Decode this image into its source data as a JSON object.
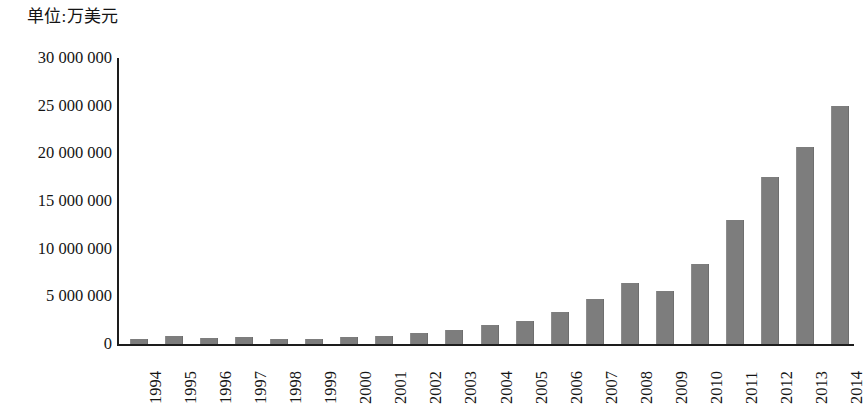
{
  "caption": {
    "unit_label": "单位:万美元"
  },
  "axes": {
    "y_tick_labels": [
      "30 000 000",
      "25 000 000",
      "20 000 000",
      "15 000 000",
      "10 000 000",
      "5 000 000",
      "0"
    ],
    "y_tick_values": [
      30000000,
      25000000,
      20000000,
      15000000,
      10000000,
      5000000,
      0
    ],
    "x_tick_labels": [
      "1994",
      "1995",
      "1996",
      "1997",
      "1998",
      "1999",
      "2000",
      "2001",
      "2002",
      "2003",
      "2004",
      "2005",
      "2006",
      "2007",
      "2008",
      "2009",
      "2010",
      "2011",
      "2012",
      "2013",
      "2014"
    ]
  },
  "style": {
    "bar_color": "#7d7d7d",
    "axis_color": "#1d1d1d",
    "background": "#ffffff",
    "text_color": "#141414"
  },
  "chart_data": {
    "type": "bar",
    "title": "",
    "subtitle": "",
    "xlabel": "",
    "ylabel": "单位:万美元",
    "ylim": [
      0,
      30000000
    ],
    "grid": false,
    "legend": "none",
    "categories": [
      "1994",
      "1995",
      "1996",
      "1997",
      "1998",
      "1999",
      "2000",
      "2001",
      "2002",
      "2003",
      "2004",
      "2005",
      "2006",
      "2007",
      "2008",
      "2009",
      "2010",
      "2011",
      "2012",
      "2013",
      "2014"
    ],
    "values": [
      600000,
      850000,
      650000,
      750000,
      600000,
      550000,
      800000,
      900000,
      1150000,
      1550000,
      2050000,
      2500000,
      3450000,
      4800000,
      6450000,
      5650000,
      8400000,
      13100000,
      17600000,
      20700000,
      25000000
    ],
    "annotations": []
  }
}
